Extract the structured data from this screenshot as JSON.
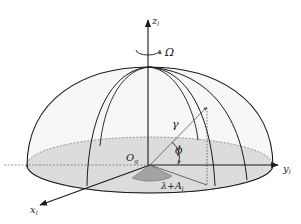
{
  "figure": {
    "labels": {
      "z_axis": "z",
      "z_sub": "l",
      "y_axis": "y",
      "y_sub": "l",
      "x_axis": "x",
      "x_sub": "l",
      "omega": "Ω",
      "origin": "O",
      "origin_sub": "g",
      "gamma": "γ",
      "phi": "ϕ",
      "angle_lambda": "λ+A",
      "angle_lambda_sub": "l"
    },
    "colors": {
      "line": "#1a1a1a",
      "base_fill": "#d9d9d9",
      "base_dark": "#a8a8a8",
      "dome_fill": "#f6f6f6"
    }
  }
}
